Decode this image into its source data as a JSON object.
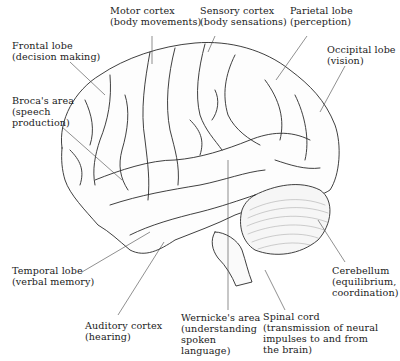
{
  "diagram": {
    "labels": [
      {
        "id": "motor-cortex",
        "name": "Motor cortex",
        "desc": "(body movements)",
        "x": 110,
        "y": 5
      },
      {
        "id": "sensory-cortex",
        "name": "Sensory cortex",
        "desc": "(body sensations)",
        "x": 200,
        "y": 5
      },
      {
        "id": "parietal-lobe",
        "name": "Parietal lobe",
        "desc": "(perception)",
        "x": 290,
        "y": 5
      },
      {
        "id": "frontal-lobe",
        "name": "Frontal lobe",
        "desc": "(decision making)",
        "x": 12,
        "y": 40
      },
      {
        "id": "occipital-lobe",
        "name": "Occipital lobe",
        "desc": "(vision)",
        "x": 327,
        "y": 44
      },
      {
        "id": "brocas-area",
        "name": "Broca's area",
        "desc1": "(speech",
        "desc2": "production)",
        "x": 12,
        "y": 95
      },
      {
        "id": "temporal-lobe",
        "name": "Temporal lobe",
        "desc": "(verbal memory)",
        "x": 12,
        "y": 265
      },
      {
        "id": "auditory-cortex",
        "name": "Auditory cortex",
        "desc": "(hearing)",
        "x": 85,
        "y": 320
      },
      {
        "id": "wernickes-area",
        "name": "Wernicke's area",
        "desc1": "(understanding",
        "desc2": "spoken",
        "desc3": "language)",
        "x": 181,
        "y": 312
      },
      {
        "id": "spinal-cord",
        "name": "Spinal cord",
        "desc1": "(transmission of neural",
        "desc2": "impulses to and from",
        "desc3": "the brain)",
        "x": 263,
        "y": 311
      },
      {
        "id": "cerebellum",
        "name": "Cerebellum",
        "desc1": "(equilibrium,",
        "desc2": "coordination)",
        "x": 332,
        "y": 265
      }
    ]
  }
}
